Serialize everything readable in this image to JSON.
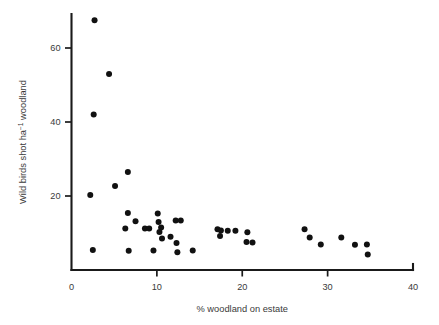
{
  "chart_data": {
    "type": "scatter",
    "title": "",
    "xlabel": "% woodland on estate",
    "ylabel_parts": {
      "main": "Wild birds shot ha",
      "superscript": "−1",
      "tail": " woodland"
    },
    "ylabel": "Wild birds shot ha⁻¹ woodland",
    "xlim": [
      0,
      40
    ],
    "ylim": [
      0,
      72
    ],
    "xticks": [
      0,
      10,
      20,
      30,
      40
    ],
    "xtick_labels": [
      "0",
      "10",
      "20",
      "30",
      "40"
    ],
    "yticks": [
      20,
      40,
      60
    ],
    "ytick_labels": [
      "20",
      "40",
      "60"
    ],
    "grid": false,
    "legend": null,
    "marker": {
      "shape": "circle",
      "color": "#111111",
      "radius_px": 3.0
    },
    "points": [
      {
        "x": 2.7,
        "y": 67.5
      },
      {
        "x": 4.4,
        "y": 53.0
      },
      {
        "x": 2.6,
        "y": 42.0
      },
      {
        "x": 2.2,
        "y": 20.3
      },
      {
        "x": 6.6,
        "y": 26.5
      },
      {
        "x": 5.1,
        "y": 22.7
      },
      {
        "x": 2.5,
        "y": 5.4
      },
      {
        "x": 6.7,
        "y": 5.2
      },
      {
        "x": 6.6,
        "y": 15.4
      },
      {
        "x": 7.5,
        "y": 13.2
      },
      {
        "x": 6.3,
        "y": 11.2
      },
      {
        "x": 8.6,
        "y": 11.2
      },
      {
        "x": 9.1,
        "y": 11.2
      },
      {
        "x": 10.1,
        "y": 15.3
      },
      {
        "x": 10.2,
        "y": 13.0
      },
      {
        "x": 10.5,
        "y": 11.5
      },
      {
        "x": 10.3,
        "y": 10.3
      },
      {
        "x": 10.6,
        "y": 8.5
      },
      {
        "x": 9.6,
        "y": 5.3
      },
      {
        "x": 12.2,
        "y": 13.4
      },
      {
        "x": 12.8,
        "y": 13.4
      },
      {
        "x": 11.6,
        "y": 9.0
      },
      {
        "x": 12.3,
        "y": 7.3
      },
      {
        "x": 12.4,
        "y": 4.8
      },
      {
        "x": 14.2,
        "y": 5.3
      },
      {
        "x": 17.1,
        "y": 11.0
      },
      {
        "x": 17.5,
        "y": 10.7
      },
      {
        "x": 17.4,
        "y": 9.2
      },
      {
        "x": 18.3,
        "y": 10.6
      },
      {
        "x": 19.2,
        "y": 10.6
      },
      {
        "x": 20.6,
        "y": 10.2
      },
      {
        "x": 20.5,
        "y": 7.6
      },
      {
        "x": 21.2,
        "y": 7.4
      },
      {
        "x": 27.3,
        "y": 11.0
      },
      {
        "x": 27.9,
        "y": 8.8
      },
      {
        "x": 29.2,
        "y": 6.9
      },
      {
        "x": 31.6,
        "y": 8.8
      },
      {
        "x": 33.2,
        "y": 6.8
      },
      {
        "x": 34.6,
        "y": 6.9
      },
      {
        "x": 34.7,
        "y": 4.2
      }
    ]
  }
}
